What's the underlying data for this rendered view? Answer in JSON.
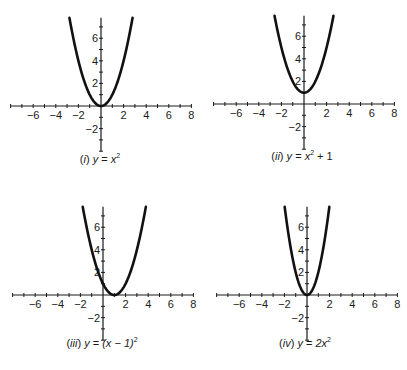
{
  "chart_data": [
    {
      "type": "line",
      "id": "i",
      "title": "(i) y = x^2",
      "caption": {
        "label": "i",
        "lhs": "y",
        "expr_base": "x",
        "expr_exp": "2",
        "tail": ""
      },
      "function": "x^2",
      "coef": 1,
      "shift_x": 0,
      "shift_y": 0,
      "xlim": [
        -8,
        8
      ],
      "ylim": [
        -4,
        7.8
      ],
      "xticks_labeled": [
        -6,
        -4,
        -2,
        2,
        4,
        6,
        8
      ],
      "yticks_labeled": [
        6,
        4,
        2,
        -2
      ],
      "grid": false
    },
    {
      "type": "line",
      "id": "ii",
      "title": "(ii) y = x^2 + 1",
      "caption": {
        "label": "ii",
        "lhs": "y",
        "expr_base": "x",
        "expr_exp": "2",
        "tail": " + 1"
      },
      "function": "x^2 + 1",
      "coef": 1,
      "shift_x": 0,
      "shift_y": 1,
      "xlim": [
        -8,
        8
      ],
      "ylim": [
        -4,
        7.8
      ],
      "xticks_labeled": [
        -6,
        -4,
        -2,
        2,
        4,
        6,
        8
      ],
      "yticks_labeled": [
        6,
        4,
        2,
        -2
      ],
      "grid": false
    },
    {
      "type": "line",
      "id": "iii",
      "title": "(iii) y = (x - 1)^2",
      "caption": {
        "label": "iii",
        "lhs": "y",
        "expr_base": "(x − 1)",
        "expr_exp": "2",
        "tail": ""
      },
      "function": "(x - 1)^2",
      "coef": 1,
      "shift_x": 1,
      "shift_y": 0,
      "xlim": [
        -8,
        8
      ],
      "ylim": [
        -4,
        7.8
      ],
      "xticks_labeled": [
        -6,
        -4,
        -2,
        2,
        4,
        6,
        8
      ],
      "yticks_labeled": [
        6,
        4,
        2,
        -2
      ],
      "grid": false
    },
    {
      "type": "line",
      "id": "iv",
      "title": "(iv) y = 2x^2",
      "caption": {
        "label": "iv",
        "lhs": "y",
        "expr_base": "2x",
        "expr_exp": "2",
        "tail": ""
      },
      "function": "2x^2",
      "coef": 2,
      "shift_x": 0,
      "shift_y": 0,
      "xlim": [
        -8,
        8
      ],
      "ylim": [
        -4,
        7.8
      ],
      "xticks_labeled": [
        -6,
        -4,
        -2,
        2,
        4,
        6,
        8
      ],
      "yticks_labeled": [
        6,
        4,
        2,
        -2
      ],
      "grid": false
    }
  ],
  "layout": {
    "unit_px": 11.3,
    "panels": [
      {
        "ox": 101,
        "oy": 106,
        "cap_x": 100,
        "cap_y": 163
      },
      {
        "ox": 304,
        "oy": 104,
        "cap_x": 302,
        "cap_y": 160
      },
      {
        "ox": 103,
        "oy": 295,
        "cap_x": 102,
        "cap_y": 347
      },
      {
        "ox": 307,
        "oy": 295,
        "cap_x": 305,
        "cap_y": 347
      }
    ],
    "axis_color": "#1a1a1a",
    "curve_color": "#111111"
  }
}
